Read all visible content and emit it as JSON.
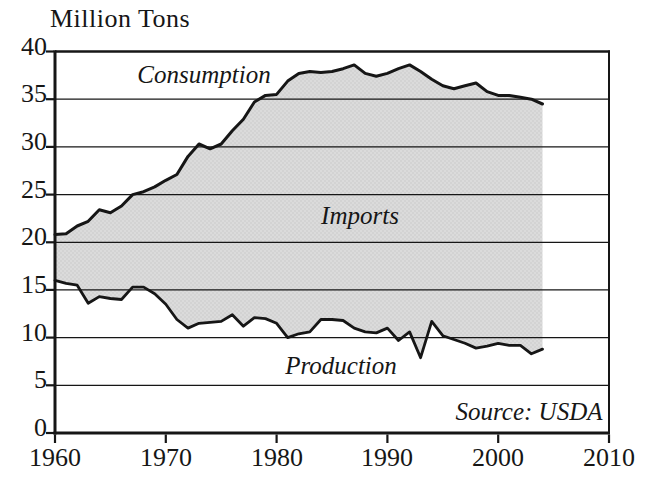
{
  "chart": {
    "title": "Million Tons",
    "annotations": {
      "consumption": "Consumption",
      "imports": "Imports",
      "production": "Production",
      "source": "Source: USDA"
    }
  },
  "chart_data": {
    "type": "area",
    "title": "Million Tons",
    "ylabel": "Million Tons",
    "xlabel": "",
    "grid": "horizontal",
    "legend_position": "inline-annotations",
    "source_note": "Source: USDA",
    "band_between_series_label": "Imports",
    "xlim": [
      1960,
      2010
    ],
    "ylim": [
      0,
      40
    ],
    "x_label_ticks": [
      1960,
      1970,
      1980,
      1990,
      2000,
      2010
    ],
    "y_label_ticks": [
      0,
      5,
      10,
      15,
      20,
      25,
      30,
      35,
      40
    ],
    "x": [
      1960,
      1961,
      1962,
      1963,
      1964,
      1965,
      1966,
      1967,
      1968,
      1969,
      1970,
      1971,
      1972,
      1973,
      1974,
      1975,
      1976,
      1977,
      1978,
      1979,
      1980,
      1981,
      1982,
      1983,
      1984,
      1985,
      1986,
      1987,
      1988,
      1989,
      1990,
      1991,
      1992,
      1993,
      1994,
      1995,
      1996,
      1997,
      1998,
      1999,
      2000,
      2001,
      2002,
      2003,
      2004
    ],
    "series": [
      {
        "name": "Consumption",
        "values": [
          20.8,
          20.9,
          21.7,
          22.2,
          23.4,
          23.1,
          23.8,
          25.0,
          25.3,
          25.8,
          26.5,
          27.1,
          29.0,
          30.3,
          29.8,
          30.3,
          31.7,
          32.9,
          34.7,
          35.4,
          35.5,
          36.9,
          37.7,
          37.9,
          37.8,
          37.9,
          38.2,
          38.6,
          37.7,
          37.4,
          37.7,
          38.2,
          38.6,
          37.9,
          37.1,
          36.4,
          36.1,
          36.4,
          36.7,
          35.8,
          35.4,
          35.4,
          35.2,
          35.0,
          34.5
        ]
      },
      {
        "name": "Production",
        "values": [
          16.0,
          15.7,
          15.5,
          13.6,
          14.3,
          14.1,
          14.0,
          15.3,
          15.3,
          14.6,
          13.5,
          11.9,
          11.0,
          11.5,
          11.6,
          11.7,
          12.4,
          11.2,
          12.1,
          12.0,
          11.5,
          10.0,
          10.4,
          10.6,
          11.9,
          11.9,
          11.8,
          11.0,
          10.6,
          10.5,
          11.0,
          9.7,
          10.6,
          7.9,
          11.7,
          10.2,
          9.8,
          9.4,
          8.9,
          9.1,
          9.4,
          9.2,
          9.2,
          8.3,
          8.8
        ]
      }
    ],
    "colors": {
      "line": "#161616",
      "band_fill": "#dbdbdb",
      "band_dot": "#c9c9c9",
      "background": "#ffffff"
    }
  }
}
